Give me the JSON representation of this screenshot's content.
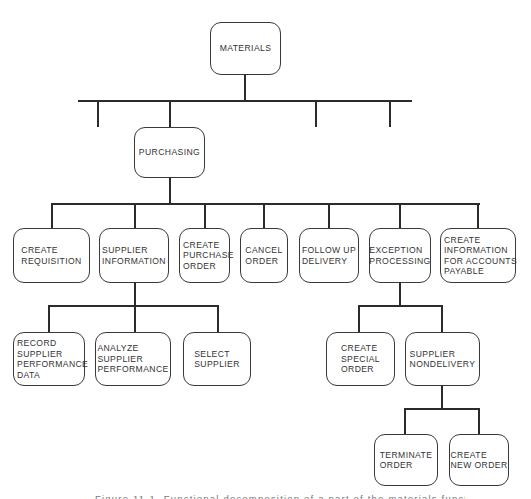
{
  "diagram": {
    "type": "hierarchy-chart",
    "root": {
      "label": "MATERIALS",
      "children": [
        {
          "label": ""
        },
        {
          "label": "PURCHASING",
          "children": [
            {
              "label": "CREATE\nREQUISITION"
            },
            {
              "label": "SUPPLIER\nINFORMATION",
              "children": [
                {
                  "label": "RECORD\nSUPPLIER\nPERFORMANCE\nDATA"
                },
                {
                  "label": "ANALYZE\nSUPPLIER\nPERFORMANCE"
                },
                {
                  "label": "SELECT\nSUPPLIER"
                }
              ]
            },
            {
              "label": "CREATE\nPURCHASE\nORDER"
            },
            {
              "label": "CANCEL\nORDER"
            },
            {
              "label": "FOLLOW UP\nDELIVERY"
            },
            {
              "label": "EXCEPTION\nPROCESSING",
              "children": [
                {
                  "label": "CREATE\nSPECIAL\nORDER"
                },
                {
                  "label": "SUPPLIER\nNONDELIVERY",
                  "children": [
                    {
                      "label": "TERMINATE\nORDER"
                    },
                    {
                      "label": "CREATE\nNEW ORDER"
                    }
                  ]
                }
              ]
            },
            {
              "label": "CREATE\nINFORMATION\nFOR ACCOUNTS\nPAYABLE"
            }
          ]
        },
        {
          "label": ""
        },
        {
          "label": ""
        }
      ]
    }
  },
  "nodes": {
    "materials": "MATERIALS",
    "purchasing": "PURCHASING",
    "create_requisition": "CREATE\nREQUISITION",
    "supplier_information": "SUPPLIER\nINFORMATION",
    "create_purchase_order": "CREATE\nPURCHASE\nORDER",
    "cancel_order": "CANCEL\nORDER",
    "follow_up_delivery": "FOLLOW UP\nDELIVERY",
    "exception_processing": "EXCEPTION\nPROCESSING",
    "create_info_accounts_payable": "CREATE\nINFORMATION\nFOR ACCOUNTS\nPAYABLE",
    "record_supplier_performance_data": "RECORD\nSUPPLIER\nPERFORMANCE\nDATA",
    "analyze_supplier_performance": "ANALYZE\nSUPPLIER\nPERFORMANCE",
    "select_supplier": "SELECT\nSUPPLIER",
    "create_special_order": "CREATE\nSPECIAL\nORDER",
    "supplier_nondelivery": "SUPPLIER\nNONDELIVERY",
    "terminate_order": "TERMINATE\nORDER",
    "create_new_order": "CREATE\nNEW ORDER"
  },
  "caption": "Figure 11-1. Functional decomposition of a part of the materials function"
}
